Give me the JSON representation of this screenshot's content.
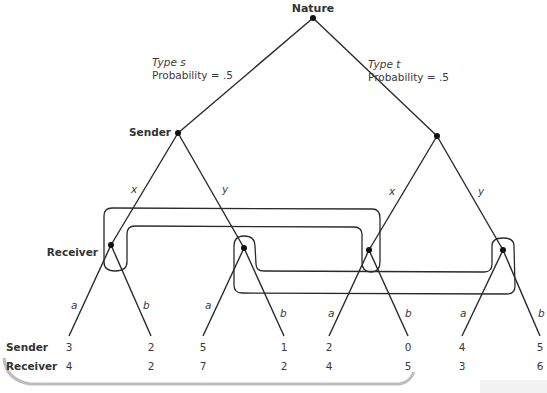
{
  "diagram": {
    "type": "extensive-form game tree (signaling game)",
    "root": {
      "label": "Nature"
    },
    "nature_branches": [
      {
        "type_label": "Type s",
        "prob_label": "Probability = .5"
      },
      {
        "type_label": "Type t",
        "prob_label": "Probability = .5"
      }
    ],
    "sender_label": "Sender",
    "receiver_label": "Receiver",
    "sender_actions": [
      "x",
      "y",
      "x",
      "y"
    ],
    "receiver_actions": [
      "a",
      "b",
      "a",
      "b",
      "a",
      "b",
      "a",
      "b"
    ],
    "payoff_row_labels": {
      "sender": "Sender",
      "receiver": "Receiver"
    },
    "payoffs": {
      "sender": [
        "3",
        "2",
        "5",
        "1",
        "2",
        "0",
        "4",
        "5"
      ],
      "receiver": [
        "4",
        "2",
        "7",
        "2",
        "4",
        "5",
        "3",
        "6"
      ]
    },
    "information_sets": [
      {
        "name": "receiver-after-x",
        "nodes": [
          "s-x",
          "t-x"
        ]
      },
      {
        "name": "receiver-after-y",
        "nodes": [
          "s-y",
          "t-y"
        ]
      }
    ],
    "colors": {
      "line": "#2a2a2a",
      "text": "#3a3a3a",
      "frame": "#bdbdbd"
    }
  }
}
